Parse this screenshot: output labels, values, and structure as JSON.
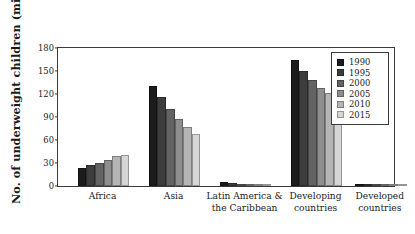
{
  "chart_data": {
    "type": "bar",
    "title": "",
    "xlabel": "",
    "ylabel": "No. of underweight children (millions)",
    "categories": [
      "Africa",
      "Asia",
      "Latin America & the Caribbean",
      "Developing countries",
      "Developed countries"
    ],
    "series": [
      {
        "name": "1990",
        "color": "#1c1c1c",
        "values": [
          24,
          131,
          5,
          164,
          2
        ]
      },
      {
        "name": "1995",
        "color": "#3d3d3d",
        "values": [
          27,
          116,
          4,
          150,
          2
        ]
      },
      {
        "name": "2000",
        "color": "#636363",
        "values": [
          30,
          101,
          3,
          138,
          1
        ]
      },
      {
        "name": "2005",
        "color": "#8e8e8e",
        "values": [
          34,
          88,
          2,
          128,
          1
        ]
      },
      {
        "name": "2010",
        "color": "#b5b5b5",
        "values": [
          39,
          77,
          2,
          121,
          1
        ]
      },
      {
        "name": "2015",
        "color": "#d6d6d6",
        "values": [
          41,
          68,
          2,
          113,
          1
        ]
      }
    ],
    "ylim": [
      0,
      180
    ],
    "yticks": [
      0,
      30,
      60,
      90,
      120,
      150,
      180
    ],
    "ytick_labels": [
      "0",
      "30",
      "60",
      "90",
      "120",
      "150",
      "180"
    ],
    "grid": false,
    "legend": {
      "position": "top-right",
      "entries": [
        "1990",
        "1995",
        "2000",
        "2005",
        "2010",
        "2015"
      ]
    },
    "frame_color": "#3a3a3a",
    "background": "#ffffff"
  }
}
